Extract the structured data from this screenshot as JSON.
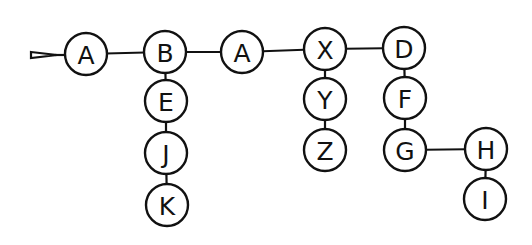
{
  "diagram": {
    "type": "tree",
    "colors": {
      "stroke": "#111111",
      "background": "#ffffff"
    },
    "entry_marker": {
      "points": "31,52 57,55 31,58",
      "line_to": [
        64,
        55
      ]
    },
    "nodes": [
      {
        "id": "n1",
        "label": "A",
        "x": 86,
        "y": 54
      },
      {
        "id": "n2",
        "label": "B",
        "x": 165,
        "y": 52
      },
      {
        "id": "n3",
        "label": "A",
        "x": 242,
        "y": 52
      },
      {
        "id": "n4",
        "label": "X",
        "x": 325,
        "y": 49
      },
      {
        "id": "n5",
        "label": "D",
        "x": 404,
        "y": 48
      },
      {
        "id": "n6",
        "label": "E",
        "x": 166,
        "y": 101
      },
      {
        "id": "n7",
        "label": "J",
        "x": 166,
        "y": 153
      },
      {
        "id": "n8",
        "label": "K",
        "x": 167,
        "y": 205
      },
      {
        "id": "n9",
        "label": "Y",
        "x": 325,
        "y": 99
      },
      {
        "id": "n10",
        "label": "Z",
        "x": 325,
        "y": 150
      },
      {
        "id": "n11",
        "label": "F",
        "x": 405,
        "y": 98
      },
      {
        "id": "n12",
        "label": "G",
        "x": 405,
        "y": 150
      },
      {
        "id": "n13",
        "label": "H",
        "x": 486,
        "y": 149
      },
      {
        "id": "n14",
        "label": "I",
        "x": 485,
        "y": 199
      }
    ],
    "edges": [
      [
        "n1",
        "n2"
      ],
      [
        "n2",
        "n3"
      ],
      [
        "n3",
        "n4"
      ],
      [
        "n4",
        "n5"
      ],
      [
        "n2",
        "n6"
      ],
      [
        "n6",
        "n7"
      ],
      [
        "n7",
        "n8"
      ],
      [
        "n4",
        "n9"
      ],
      [
        "n9",
        "n10"
      ],
      [
        "n5",
        "n11"
      ],
      [
        "n11",
        "n12"
      ],
      [
        "n12",
        "n13"
      ],
      [
        "n13",
        "n14"
      ]
    ],
    "node_radius": 21
  }
}
